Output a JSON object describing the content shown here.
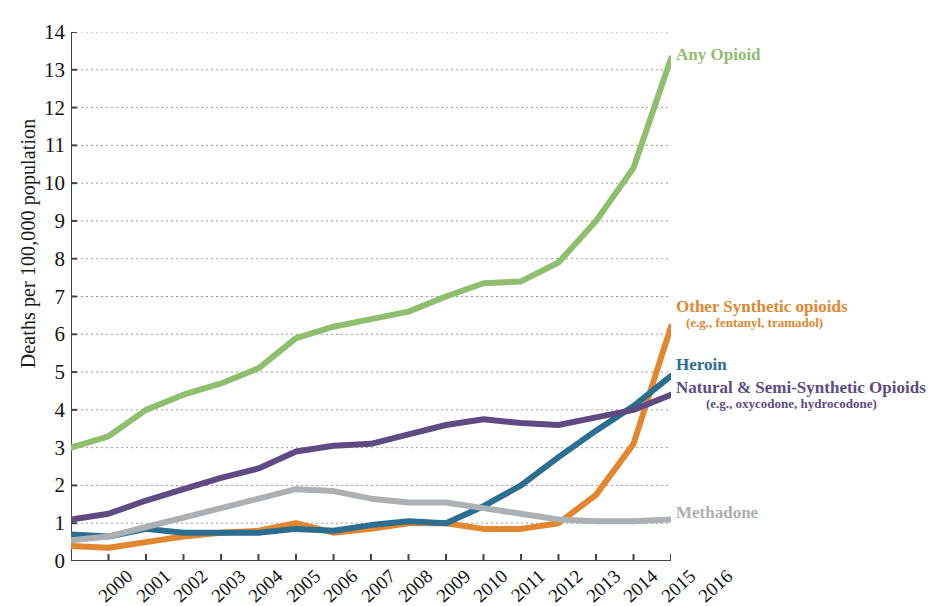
{
  "chart_data": {
    "type": "line",
    "title": "",
    "xlabel": "",
    "ylabel": "Deaths per 100,000 population",
    "ylim": [
      0,
      14
    ],
    "yticks": [
      0,
      1,
      2,
      3,
      4,
      5,
      6,
      7,
      8,
      9,
      10,
      11,
      12,
      13,
      14
    ],
    "grid": true,
    "legend_position": "right-inline",
    "x": [
      2000,
      2001,
      2002,
      2003,
      2004,
      2005,
      2006,
      2007,
      2008,
      2009,
      2010,
      2011,
      2012,
      2013,
      2014,
      2015,
      2016
    ],
    "categories": [
      "2000",
      "2001",
      "2002",
      "2003",
      "2004",
      "2005",
      "2006",
      "2007",
      "2008",
      "2009",
      "2010",
      "2011",
      "2012",
      "2013",
      "2014",
      "2015",
      "2016"
    ],
    "series": [
      {
        "name": "Any Opioid",
        "label": "Any Opioid",
        "sublabel": "",
        "color": "#8FBE6E",
        "values": [
          3.0,
          3.3,
          4.0,
          4.4,
          4.7,
          5.1,
          5.9,
          6.2,
          6.4,
          6.6,
          7.0,
          7.35,
          7.4,
          7.9,
          9.0,
          10.4,
          13.3
        ]
      },
      {
        "name": "Other Synthetic opioids",
        "label": "Other Synthetic opioids",
        "sublabel": "(e.g., fentanyl, tramadol)",
        "color": "#E2862F",
        "values": [
          0.4,
          0.35,
          0.5,
          0.65,
          0.75,
          0.8,
          1.0,
          0.75,
          0.85,
          1.0,
          1.0,
          0.85,
          0.85,
          1.0,
          1.75,
          3.1,
          6.2
        ]
      },
      {
        "name": "Heroin",
        "label": "Heroin",
        "sublabel": "",
        "color": "#2B6E8F",
        "values": [
          0.7,
          0.65,
          0.85,
          0.75,
          0.75,
          0.75,
          0.85,
          0.8,
          0.95,
          1.05,
          1.0,
          1.45,
          2.0,
          2.75,
          3.45,
          4.1,
          4.9
        ]
      },
      {
        "name": "Natural & Semi-Synthetic Opioids",
        "label": "Natural & Semi-Synthetic Opioids",
        "sublabel": "(e.g., oxycodone, hydrocodone)",
        "color": "#5E4B83",
        "values": [
          1.1,
          1.25,
          1.6,
          1.9,
          2.2,
          2.45,
          2.9,
          3.05,
          3.1,
          3.35,
          3.6,
          3.75,
          3.65,
          3.6,
          3.8,
          4.0,
          4.4
        ]
      },
      {
        "name": "Methadone",
        "label": "Methadone",
        "sublabel": "",
        "color": "#ADB0B3",
        "values": [
          0.55,
          0.65,
          0.9,
          1.15,
          1.4,
          1.65,
          1.9,
          1.85,
          1.65,
          1.55,
          1.55,
          1.4,
          1.25,
          1.1,
          1.05,
          1.05,
          1.1
        ]
      }
    ]
  },
  "y_axis": {
    "title": "Deaths per 100,000 population"
  },
  "labels": {
    "any_opioid": "Any Opioid",
    "other_synthetic": "Other Synthetic opioids",
    "other_synthetic_sub": "(e.g., fentanyl, tramadol)",
    "heroin": "Heroin",
    "natural": "Natural & Semi-Synthetic Opioids",
    "natural_sub": "(e.g., oxycodone, hydrocodone)",
    "methadone": "Methadone"
  }
}
